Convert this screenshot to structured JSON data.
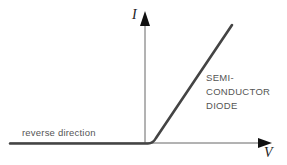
{
  "diagram": {
    "type": "current-voltage characteristic",
    "axes": {
      "y_label": "I",
      "x_label": "V"
    },
    "annotations": {
      "reverse": "reverse direction",
      "curve_label_lines": [
        "SEMI-",
        "CONDUCTOR",
        "DIODE"
      ]
    },
    "colors": {
      "axis": "#555555",
      "curve": "#444444",
      "text": "#555555"
    }
  }
}
